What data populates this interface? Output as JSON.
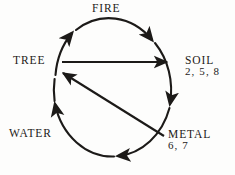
{
  "diagram": {
    "background_color": "#fdfdfc",
    "stroke_color": "#1c1a18",
    "nodes": [
      {
        "id": "fire",
        "label": "FIRE",
        "numbers": ""
      },
      {
        "id": "soil",
        "label": "SOIL",
        "numbers": "2, 5, 8"
      },
      {
        "id": "metal",
        "label": "METAL",
        "numbers": "6, 7"
      },
      {
        "id": "water",
        "label": "WATER",
        "numbers": ""
      },
      {
        "id": "tree",
        "label": "TREE",
        "numbers": ""
      }
    ],
    "edges": [
      {
        "id": "cycle-arc",
        "kind": "circle-arrow",
        "from": "water",
        "to": "tree",
        "direction": "clockwise"
      },
      {
        "id": "tree-to-soil",
        "kind": "chord-arrow",
        "from": "TREE",
        "to": "SOIL",
        "direction": "left-to-right"
      },
      {
        "id": "metal-to-tree",
        "kind": "chord-arrow",
        "from": "METAL",
        "to": "TREE",
        "direction": "lower-right-to-upper-left"
      }
    ]
  }
}
